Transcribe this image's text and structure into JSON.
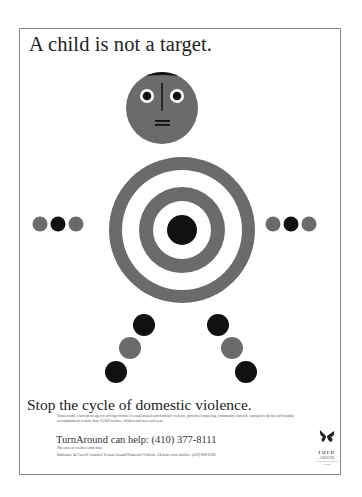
{
  "poster": {
    "headline": "A child is not a target.",
    "tagline": "Stop the cycle of domestic violence.",
    "body_copy": "TurnAround, a non-profit agency serving victims of sexual assault and domestic violence, provides counseling, community outreach, emergency shelter and hospital accompaniment to more than 10,000 women, children and men each year.",
    "help_line": "TurnAround can help: (410) 377-8111",
    "help_sub": "The cycle of violence ends here.",
    "hotline": "Baltimore & Carroll Counties' Sexual Assault/Domestic Violence 24-hour crisis hotline: (410) 828-6390",
    "logo": {
      "icon": "butterfly-icon",
      "word": "turn",
      "word2": "AROUND",
      "tag": "sexual assault domestic violence"
    }
  },
  "colors": {
    "gray": "#6b6b6b",
    "black": "#111111",
    "white": "#ffffff",
    "frame": "#8a8a8a"
  },
  "figure": {
    "head": {
      "shape": "circle",
      "color": "gray",
      "hair": "black",
      "eyes": 2,
      "nose": "vertical-line",
      "mouth": "double-dash"
    },
    "torso": {
      "shape": "target",
      "rings": [
        "gray",
        "white",
        "gray",
        "white",
        "black"
      ]
    },
    "left_arm": [
      "gray",
      "black",
      "gray"
    ],
    "right_arm": [
      "gray",
      "black",
      "gray"
    ],
    "left_leg": [
      "black",
      "gray",
      "black"
    ],
    "right_leg": [
      "black",
      "gray",
      "black"
    ]
  }
}
